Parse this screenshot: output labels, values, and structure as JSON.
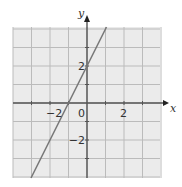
{
  "chart_data": {
    "type": "line",
    "title": "",
    "xlabel": "x",
    "ylabel": "y",
    "xlim": [
      -4,
      4
    ],
    "ylim": [
      -4,
      4
    ],
    "grid": true,
    "grid_step": 1,
    "x_tick_labels": [
      {
        "value": -2,
        "label": "−2"
      },
      {
        "value": 0,
        "label": "0"
      },
      {
        "value": 2,
        "label": "2"
      }
    ],
    "y_tick_labels": [
      {
        "value": 2,
        "label": "2"
      },
      {
        "value": -2,
        "label": "−2"
      }
    ],
    "series": [
      {
        "name": "y = 2x + 2",
        "equation": "y = 2x + 2",
        "x": [
          -3,
          -2,
          -1,
          0,
          1
        ],
        "y": [
          -4,
          -2,
          0,
          2,
          4
        ],
        "color": "#777777"
      }
    ]
  },
  "colors": {
    "grid_fill": "#ebebeb",
    "grid_line": "#bbbbbb",
    "axis": "#555555",
    "line": "#777777"
  }
}
